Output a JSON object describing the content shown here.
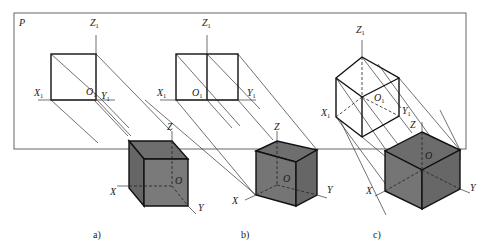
{
  "figure": {
    "plane_label": "P",
    "colors": {
      "cube_face": "#707070",
      "cube_face_dark": "#5f5f5f",
      "line": "#222222",
      "frame": "#555555"
    },
    "panels": [
      {
        "id": "a",
        "caption": "a)",
        "projection_labels": {
          "x": "X",
          "x_sub": "1",
          "y": "Y",
          "y_sub": "1",
          "z": "Z",
          "z_sub": "1",
          "o": "O",
          "o_sub": "1"
        },
        "axis_labels": {
          "x": "X",
          "y": "Y",
          "z": "Z",
          "o": "O"
        }
      },
      {
        "id": "b",
        "caption": "b)",
        "projection_labels": {
          "x": "X",
          "x_sub": "1",
          "y": "Y",
          "y_sub": "1",
          "z": "Z",
          "z_sub": "1",
          "o": "O",
          "o_sub": "1"
        },
        "axis_labels": {
          "x": "X",
          "y": "Y",
          "z": "Z",
          "o": "O"
        }
      },
      {
        "id": "c",
        "caption": "c)",
        "projection_labels": {
          "x": "X",
          "x_sub": "1",
          "y": "Y",
          "y_sub": "1",
          "z": "Z",
          "z_sub": "1",
          "o": "O",
          "o_sub": "1"
        },
        "axis_labels": {
          "x": "X",
          "y": "Y",
          "z": "Z",
          "o": "O"
        }
      }
    ]
  }
}
